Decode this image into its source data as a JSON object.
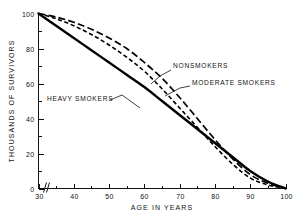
{
  "chart_data": {
    "type": "line",
    "title": "",
    "xlabel": "AGE IN YEARS",
    "ylabel": "THOUSANDS OF SURVIVORS",
    "xlim": [
      30,
      100
    ],
    "ylim": [
      0,
      100
    ],
    "xticks": [
      30,
      40,
      50,
      60,
      70,
      80,
      90,
      100
    ],
    "yticks": [
      0,
      20,
      40,
      60,
      80,
      100
    ],
    "yticks_minor": [
      10,
      30,
      50,
      70,
      90
    ],
    "grid": false,
    "legend": "inline-annotations",
    "axis_break": true,
    "x": [
      30,
      35,
      40,
      45,
      50,
      55,
      60,
      65,
      70,
      75,
      80,
      85,
      90,
      95,
      100
    ],
    "series": [
      {
        "name": "NONSMOKERS",
        "style": "dashed-long",
        "values": [
          100,
          98,
          95,
          91,
          86,
          80,
          72,
          63,
          52,
          40,
          28,
          17,
          8,
          3,
          0
        ]
      },
      {
        "name": "MODERATE SMOKERS",
        "style": "dashed-short",
        "values": [
          100,
          97,
          93,
          88,
          82,
          75,
          67,
          57,
          46,
          35,
          24,
          14,
          6,
          2,
          0
        ]
      },
      {
        "name": "HEAVY SMOKERS",
        "style": "solid",
        "values": [
          100,
          93,
          86,
          79,
          72,
          65,
          58,
          50,
          42,
          34,
          26,
          18,
          10,
          4,
          0
        ]
      }
    ],
    "annotations": [
      {
        "text": "NONSMOKERS",
        "x_px": 173,
        "y_px": 68
      },
      {
        "text": "MODERATE SMOKERS",
        "x_px": 192,
        "y_px": 85
      },
      {
        "text": "HEAVY SMOKERS",
        "x_px": 47,
        "y_px": 101
      }
    ],
    "tick_labels_x": [
      "30",
      "40",
      "50",
      "60",
      "70",
      "80",
      "90",
      "100"
    ],
    "tick_labels_y": [
      "0",
      "20",
      "40",
      "60",
      "80",
      "100"
    ]
  }
}
